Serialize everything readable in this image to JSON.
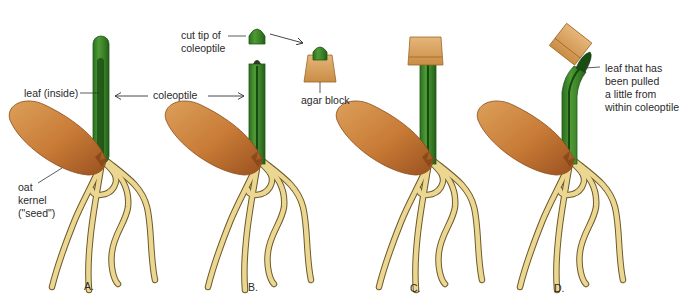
{
  "diagram": {
    "topic": "Oat coleoptile tip experiment",
    "colors": {
      "coleoptile": "#3f8a2a",
      "coleoptile_dark": "#1f5a18",
      "leaf_inside": "#174a12",
      "kernel": "#c9823a",
      "kernel_dark": "#a0561f",
      "roots": "#ead58a",
      "roots_outline": "#6b5a2a",
      "agar": "#d9a463",
      "agar_dark": "#a8722f",
      "text": "#2a2a2a",
      "background": "#ffffff"
    },
    "panels": [
      {
        "id": "A",
        "label": "A."
      },
      {
        "id": "B",
        "label": "B."
      },
      {
        "id": "C",
        "label": "C."
      },
      {
        "id": "D",
        "label": "D."
      }
    ],
    "labels": {
      "leaf_inside": "leaf (inside)",
      "coleoptile": "coleoptile",
      "oat_kernel": [
        "oat",
        "kernel",
        "(\"seed\")"
      ],
      "cut_tip": [
        "cut tip of",
        "coleoptile"
      ],
      "agar_block": "agar block",
      "pulled_leaf": [
        "leaf that has",
        "been pulled",
        "a little from",
        "within coleoptile"
      ]
    }
  }
}
